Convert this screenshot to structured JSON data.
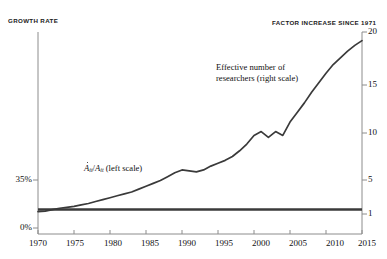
{
  "title": "",
  "axes": {
    "left_caption": "GROWTH RATE",
    "right_caption": "FACTOR INCREASE SINCE 1971",
    "left_ticks": [
      "35%",
      "0%"
    ],
    "right_ticks": [
      "20",
      "15",
      "10",
      "5",
      "1"
    ],
    "x_ticks": [
      "1970",
      "1975",
      "1980",
      "1985",
      "1990",
      "1995",
      "2000",
      "2005",
      "2010",
      "2015"
    ]
  },
  "annotations": {
    "researchers_line1": "Effective number of",
    "researchers_line2": "researchers (right scale)",
    "growth_numerator": "A",
    "growth_sub": "it",
    "growth_slash": "/",
    "growth_denominator": "A",
    "growth_scale_note": "(left scale)"
  },
  "colors": {
    "line": "#3a3a3a",
    "axis": "#8c8c8c",
    "text": "#111111",
    "background": "#ffffff"
  },
  "chart_data": {
    "type": "line",
    "title": "",
    "xlabel": "",
    "ylabel": "GROWTH RATE",
    "y2label": "FACTOR INCREASE SINCE 1971",
    "xlim": [
      1970,
      2015
    ],
    "ylim_left": [
      0,
      35
    ],
    "ylim_right": [
      1,
      20
    ],
    "grid": false,
    "legend": "inline-annotations",
    "series": [
      {
        "name": "Effective number of researchers (right scale)",
        "axis": "right",
        "x": [
          1970,
          1971,
          1972,
          1973,
          1974,
          1975,
          1976,
          1977,
          1978,
          1979,
          1980,
          1981,
          1982,
          1983,
          1984,
          1985,
          1986,
          1987,
          1988,
          1989,
          1990,
          1991,
          1992,
          1993,
          1994,
          1995,
          1996,
          1997,
          1998,
          1999,
          2000,
          2001,
          2002,
          2003,
          2004,
          2005,
          2006,
          2007,
          2008,
          2009,
          2010,
          2011,
          2012,
          2013,
          2014,
          2015
        ],
        "values": [
          1.25,
          1.3,
          1.45,
          1.6,
          1.7,
          1.8,
          1.95,
          2.1,
          2.3,
          2.5,
          2.7,
          2.9,
          3.1,
          3.3,
          3.6,
          3.9,
          4.2,
          4.5,
          4.9,
          5.3,
          5.6,
          5.5,
          5.4,
          5.6,
          6.0,
          6.3,
          6.6,
          7.0,
          7.6,
          8.3,
          9.2,
          9.6,
          9.0,
          9.6,
          9.2,
          10.6,
          11.6,
          12.6,
          13.7,
          14.7,
          15.7,
          16.6,
          17.3,
          18.0,
          18.6,
          19.1
        ]
      },
      {
        "name": "Ȧ(it)/A(it) (left scale)",
        "axis": "left",
        "x": [
          1970,
          2015
        ],
        "values": [
          13.5,
          13.5
        ],
        "note": "flat constant research-productivity-normalized growth rate line"
      }
    ]
  }
}
